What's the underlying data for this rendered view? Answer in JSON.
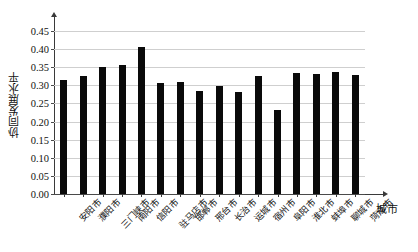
{
  "chart_data": {
    "type": "bar",
    "title": "",
    "xlabel": "城市",
    "ylabel": "协同发展水平",
    "ylim": [
      0.0,
      0.475
    ],
    "grid": true,
    "legend": null,
    "y_ticks": [
      "0.00",
      "0.05",
      "0.10",
      "0.15",
      "0.20",
      "0.25",
      "0.30",
      "0.35",
      "0.40",
      "0.45"
    ],
    "y_tick_values": [
      0.0,
      0.05,
      0.1,
      0.15,
      0.2,
      0.25,
      0.3,
      0.35,
      0.4,
      0.45
    ],
    "bar_color": "#0a0a0a",
    "categories": [
      "安阳市",
      "濮阳市",
      "三门峡市",
      "南阳市",
      "信阳市",
      "驻马店市",
      "邯郸市",
      "邢台市",
      "长治市",
      "运城市",
      "宿州市",
      "阜阳市",
      "淮北市",
      "蚌埠市",
      "聊城市",
      "菏泽市"
    ],
    "values": [
      0.316,
      0.326,
      0.351,
      0.357,
      0.406,
      0.306,
      0.31,
      0.284,
      0.297,
      0.281,
      0.327,
      0.232,
      0.335,
      0.332,
      0.338,
      0.328
    ]
  }
}
